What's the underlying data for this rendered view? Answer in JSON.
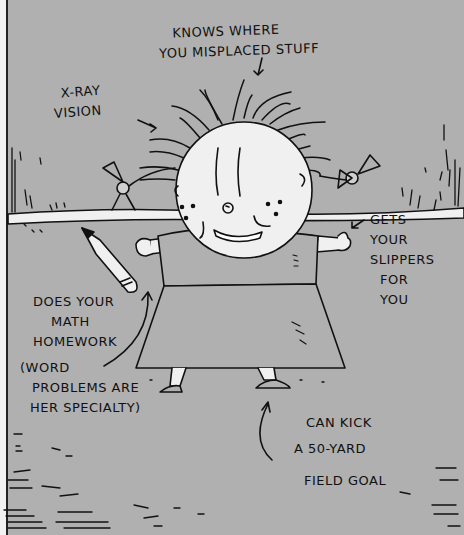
{
  "illustration": {
    "background_color": "#b0b0b0",
    "ink_color": "#111111",
    "paper_color": "#f0f0f0",
    "annotations": [
      {
        "id": "knows-where",
        "lines": [
          "KNOWS WHERE",
          "YOU MISPLACED STUFF"
        ]
      },
      {
        "id": "xray",
        "lines": [
          "X-RAY",
          "VISION"
        ]
      },
      {
        "id": "slippers",
        "lines": [
          "GETS",
          "YOUR",
          "SLIPPERS",
          "FOR",
          "YOU"
        ]
      },
      {
        "id": "homework",
        "lines": [
          "DOES YOUR",
          "MATH",
          "HOMEWORK"
        ]
      },
      {
        "id": "word-problems",
        "lines": [
          "(WORD",
          "PROBLEMS ARE",
          "HER SPECIALTY)"
        ]
      },
      {
        "id": "field-goal",
        "lines": [
          "CAN KICK",
          "A 50-YARD",
          "FIELD GOAL"
        ]
      }
    ]
  }
}
